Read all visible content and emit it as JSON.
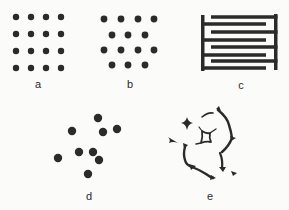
{
  "figure": {
    "ink_color": "#2b2b2b",
    "background": "#fbfbfa",
    "panels": [
      {
        "id": "a",
        "label": "a",
        "description": "square lattice of particles",
        "label_pos": [
          38,
          84
        ],
        "dots": [
          [
            16,
            17
          ],
          [
            31,
            17
          ],
          [
            46,
            17
          ],
          [
            61,
            17
          ],
          [
            16,
            34
          ],
          [
            31,
            34
          ],
          [
            46,
            34
          ],
          [
            61,
            34
          ],
          [
            16,
            51
          ],
          [
            31,
            51
          ],
          [
            46,
            51
          ],
          [
            61,
            51
          ],
          [
            16,
            68
          ],
          [
            31,
            68
          ],
          [
            46,
            68
          ],
          [
            61,
            68
          ]
        ],
        "dot_radius": 3.2
      },
      {
        "id": "b",
        "label": "b",
        "description": "hexagonal (staggered) lattice of particles",
        "label_pos": [
          130,
          84
        ],
        "dots": [
          [
            104,
            19
          ],
          [
            121,
            19
          ],
          [
            138,
            19
          ],
          [
            154,
            19
          ],
          [
            112,
            35
          ],
          [
            128,
            35
          ],
          [
            145,
            35
          ],
          [
            104,
            50
          ],
          [
            121,
            50
          ],
          [
            138,
            50
          ],
          [
            154,
            50
          ],
          [
            112,
            65
          ],
          [
            128,
            65
          ],
          [
            145,
            65
          ]
        ],
        "dot_radius": 3.4
      },
      {
        "id": "c",
        "label": "c",
        "description": "interdigitated lamellar comb structure",
        "label_pos": [
          241,
          85
        ],
        "left_bar": {
          "x": 201,
          "y1": 15,
          "y2": 71,
          "w": 3.5
        },
        "right_bar": {
          "x": 274,
          "y1": 14,
          "y2": 70,
          "w": 3.5
        },
        "left_fingers_y": [
          24,
          40,
          55,
          68
        ],
        "right_fingers_y": [
          17,
          32,
          47,
          61
        ],
        "finger_thickness": 3.5
      },
      {
        "id": "d",
        "label": "d",
        "description": "random / disordered particles",
        "label_pos": [
          89,
          196
        ],
        "dots": [
          [
            98,
            118
          ],
          [
            72,
            131
          ],
          [
            103,
            132
          ],
          [
            117,
            129
          ],
          [
            79,
            152
          ],
          [
            93,
            152
          ],
          [
            58,
            158
          ],
          [
            99,
            160
          ],
          [
            88,
            174
          ]
        ],
        "dot_radius": 4.2
      },
      {
        "id": "e",
        "label": "e",
        "description": "foam-like network with Plateau borders",
        "label_pos": [
          210,
          196
        ]
      }
    ]
  }
}
